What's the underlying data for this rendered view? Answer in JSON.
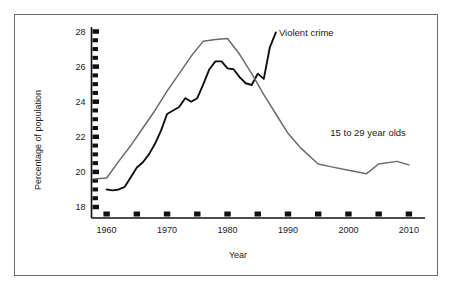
{
  "chart_data": {
    "type": "line",
    "title": "",
    "xlabel": "Year",
    "ylabel": "Percentage of population",
    "xlim": [
      1957.5,
      2012.5
    ],
    "ylim": [
      17.4,
      28.4
    ],
    "grid": false,
    "legend_position": "inline-annotation",
    "x_ticks": [
      1960,
      1965,
      1970,
      1975,
      1980,
      1985,
      1990,
      1995,
      2000,
      2005,
      2010
    ],
    "x_tick_labels": [
      "1960",
      "",
      "1970",
      "",
      "1980",
      "",
      "1990",
      "",
      "2000",
      "",
      "2010"
    ],
    "y_ticks": [
      18,
      18.5,
      19,
      19.5,
      20,
      20.5,
      21,
      21.5,
      22,
      22.5,
      23,
      23.5,
      24,
      24.5,
      25,
      25.5,
      26,
      26.5,
      27,
      27.5,
      28
    ],
    "y_tick_labels": [
      "18",
      "",
      "",
      "",
      "20",
      "",
      "",
      "",
      "22",
      "",
      "",
      "",
      "24",
      "",
      "",
      "",
      "26",
      "",
      "",
      "",
      "28"
    ],
    "y_major_ticks": [
      18,
      20,
      22,
      24,
      26,
      28
    ],
    "series": [
      {
        "name": "Violent crime",
        "color": "#111111",
        "width": 1.9,
        "label_x": 1988.5,
        "label_y": 27.9,
        "x": [
          1960,
          1961,
          1962,
          1963,
          1964,
          1965,
          1966,
          1967,
          1968,
          1969,
          1970,
          1971,
          1972,
          1973,
          1974,
          1975,
          1976,
          1977,
          1978,
          1979,
          1980,
          1981,
          1982,
          1983,
          1984,
          1985,
          1986,
          1987,
          1988
        ],
        "y": [
          19.0,
          18.95,
          19.0,
          19.15,
          19.7,
          20.25,
          20.55,
          21.0,
          21.6,
          22.35,
          23.3,
          23.5,
          23.7,
          24.2,
          24.0,
          24.2,
          25.0,
          25.85,
          26.3,
          26.3,
          25.9,
          25.85,
          25.4,
          25.05,
          24.95,
          25.6,
          25.3,
          27.1,
          27.95
        ]
      },
      {
        "name": "15 to 29 year olds",
        "color": "#6b6b6b",
        "width": 1.5,
        "label_x": 1997.0,
        "label_y": 22.2,
        "x": [
          1958,
          1960,
          1962,
          1964,
          1966,
          1968,
          1970,
          1972,
          1974,
          1976,
          1978,
          1980,
          1982,
          1984,
          1986,
          1988,
          1990,
          1992,
          1995,
          1997,
          2000,
          2003,
          2005,
          2008,
          2010
        ],
        "y": [
          19.6,
          19.65,
          20.6,
          21.5,
          22.5,
          23.5,
          24.6,
          25.6,
          26.6,
          27.45,
          27.55,
          27.6,
          26.7,
          25.6,
          24.4,
          23.3,
          22.2,
          21.4,
          20.45,
          20.3,
          20.1,
          19.9,
          20.45,
          20.6,
          20.4
        ]
      }
    ]
  },
  "labels": {
    "ylabel": "Percentage of population",
    "xlabel": "Year",
    "violent_crime": "Violent crime",
    "age_group": "15 to 29 year olds"
  },
  "colors": {
    "violent_crime_line": "#111111",
    "age_group_line": "#6b6b6b",
    "axis": "#111111",
    "frame": "#6b6b6b",
    "background": "#ffffff",
    "text": "#1a1a1a"
  }
}
